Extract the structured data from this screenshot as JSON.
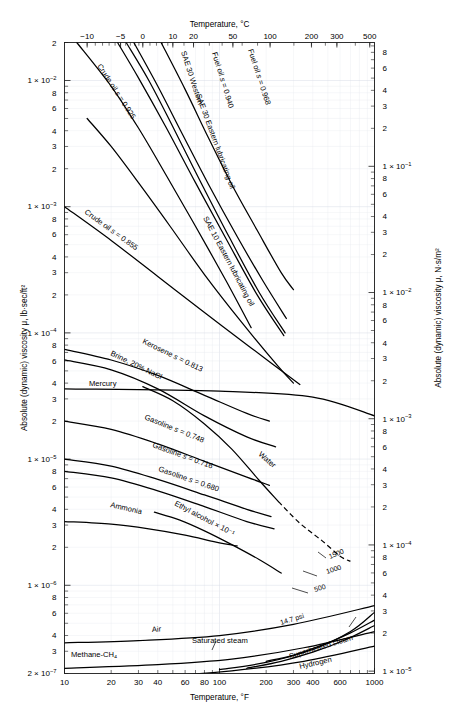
{
  "figure": {
    "title_top_axis": "Temperature, °C",
    "title_bottom_axis": "Temperature, °F",
    "title_left_axis": "Absolute (dynamic) viscosity μ, lb·sec/ft²",
    "title_right_axis": "Absolute (dynamic) viscosity μ, N·s/m²"
  },
  "axes": {
    "x_bottom": {
      "unit": "°F",
      "scale": "log",
      "range": [
        10,
        1000
      ],
      "tick_labels": [
        "10",
        "20",
        "30",
        "40",
        "60",
        "80",
        "100",
        "200",
        "300",
        "400",
        "600",
        "1000"
      ],
      "tick_values": [
        10,
        20,
        30,
        40,
        60,
        80,
        100,
        200,
        300,
        400,
        600,
        1000
      ]
    },
    "x_top": {
      "unit": "°C",
      "scale": "log-in-F",
      "tick_labels": [
        "−10",
        "−5",
        "0",
        "10",
        "20",
        "50",
        "100",
        "200",
        "300",
        "500"
      ],
      "tick_values_c": [
        -10,
        -5,
        0,
        10,
        20,
        50,
        100,
        200,
        300,
        500
      ]
    },
    "y_left": {
      "unit": "lb·sec/ft²",
      "scale": "log",
      "range": [
        2e-07,
        0.02
      ],
      "decade_labels": [
        "1 × 10⁻²",
        "1 × 10⁻³",
        "1 × 10⁻⁴",
        "1 × 10⁻⁵",
        "1 × 10⁻⁶",
        "2 × 10⁻⁷"
      ],
      "top_label": "2",
      "minor_labels": [
        "8",
        "6",
        "4",
        "3",
        "2"
      ]
    },
    "y_right": {
      "unit": "N·s/m²",
      "scale": "log",
      "decade_labels": [
        "1 × 10⁰",
        "1 × 10⁻¹",
        "1 × 10⁻²",
        "1 × 10⁻³",
        "1 × 10⁻⁴",
        "1 × 10⁻⁵"
      ],
      "minor_labels": [
        "8",
        "6",
        "4",
        "3",
        "2"
      ],
      "bottom_label": "8"
    }
  },
  "chart_data": {
    "type": "line",
    "title": "",
    "xlabel": "Temperature, °F",
    "ylabel": "Absolute (dynamic) viscosity μ, lb·sec/ft²",
    "xscale": "log",
    "yscale": "log",
    "xlim": [
      10,
      1000
    ],
    "ylim": [
      2e-07,
      0.02
    ],
    "grid": true,
    "legend": "inline-curve-labels",
    "series": [
      {
        "name": "Crude oil s = 0.925",
        "label": "Crude oil s = 0.925",
        "label_italic_part": "s",
        "x": [
          12,
          20,
          30,
          45,
          70,
          110,
          160
        ],
        "y": [
          0.02,
          0.009,
          0.0042,
          0.0018,
          0.0007,
          0.00026,
          0.00011
        ]
      },
      {
        "name": "SAE 30 Western lubricating oil",
        "label": "SAE 30 Western",
        "x": [
          22,
          30,
          45,
          70,
          110,
          175,
          260
        ],
        "y": [
          0.02,
          0.0105,
          0.0043,
          0.00155,
          0.00056,
          0.0002,
          9.5e-05
        ]
      },
      {
        "name": "SAE 30 Eastern lubricating oil",
        "label": "SAE 30 Eastern lubricating oil",
        "x": [
          25,
          35,
          50,
          75,
          115,
          180,
          265
        ],
        "y": [
          0.02,
          0.01,
          0.0043,
          0.0016,
          0.00058,
          0.00021,
          0.0001
        ]
      },
      {
        "name": "Fuel oil s = 0.940",
        "label": "Fuel oil s = 0.940",
        "label_italic_part": "s",
        "x": [
          28,
          40,
          58,
          85,
          130,
          190,
          270
        ],
        "y": [
          0.02,
          0.009,
          0.0037,
          0.0015,
          0.00058,
          0.00026,
          0.00013
        ]
      },
      {
        "name": "Fuel oil s = 0.968",
        "label": "Fuel oil s = 0.968",
        "label_italic_part": "s",
        "x": [
          42,
          60,
          85,
          120,
          175,
          250,
          300
        ],
        "y": [
          0.02,
          0.0085,
          0.0035,
          0.0015,
          0.00065,
          0.0003,
          0.00022
        ]
      },
      {
        "name": "SAE 10 Eastern lubricating oil",
        "label": "SAE 10 Eastern lubricating oil",
        "x": [
          14,
          20,
          30,
          48,
          80,
          140,
          240,
          300
        ],
        "y": [
          0.005,
          0.003,
          0.00155,
          0.0007,
          0.00029,
          0.00012,
          5.4e-05,
          4e-05
        ]
      },
      {
        "name": "Crude oil s = 0.855",
        "label": "Crude oil s = 0.855",
        "label_italic_part": "s",
        "x": [
          10,
          20,
          40,
          80,
          160,
          330
        ],
        "y": [
          0.001,
          0.00054,
          0.00028,
          0.000145,
          7.6e-05,
          3.9e-05
        ]
      },
      {
        "name": "Kerosene s = 0.813",
        "label": "Kerosene s = 0.813",
        "label_italic_part": "s",
        "x": [
          10,
          20,
          40,
          80,
          150,
          210
        ],
        "y": [
          7.4e-05,
          6.1e-05,
          4.6e-05,
          3.2e-05,
          2.3e-05,
          2e-05
        ]
      },
      {
        "name": "Brine, 20% NaCl",
        "label": "Brine, 20% NaCl",
        "x": [
          10,
          20,
          40,
          80,
          150,
          230
        ],
        "y": [
          6.1e-05,
          5.1e-05,
          3.6e-05,
          2.2e-05,
          1.5e-05,
          1.25e-05
        ]
      },
      {
        "name": "Mercury",
        "label": "Mercury",
        "x": [
          10,
          100,
          400,
          1000
        ],
        "y": [
          3.6e-05,
          3.45e-05,
          3.1e-05,
          2.2e-05
        ]
      },
      {
        "name": "Water",
        "label": "Water",
        "x": [
          32,
          50,
          80,
          120,
          180,
          240
        ],
        "y": [
          3.75e-05,
          2.9e-05,
          1.9e-05,
          1.2e-05,
          6.8e-06,
          4.6e-06
        ],
        "dashed_extension": {
          "x": [
            240,
            330,
            450,
            600,
            700
          ],
          "y": [
            4.6e-06,
            3.1e-06,
            2.3e-06,
            1.7e-06,
            1.55e-06
          ]
        }
      },
      {
        "name": "Gasoline s = 0.748",
        "label": "Gasoline s = 0.748",
        "label_italic_part": "s",
        "x": [
          10,
          20,
          40,
          80,
          150,
          210
        ],
        "y": [
          2e-05,
          1.72e-05,
          1.32e-05,
          9.6e-06,
          7.2e-06,
          6.2e-06
        ]
      },
      {
        "name": "Gasoline s = 0.716",
        "label": "Gasoline s = 0.716",
        "label_italic_part": "s",
        "x": [
          10,
          20,
          40,
          80,
          150,
          215
        ],
        "y": [
          1e-05,
          8.8e-06,
          6.9e-06,
          5.2e-06,
          4e-06,
          3.5e-06
        ]
      },
      {
        "name": "Gasoline s = 0.680",
        "label": "Gasoline s = 0.680",
        "label_italic_part": "s",
        "x": [
          10,
          20,
          40,
          80,
          150,
          225
        ],
        "y": [
          8e-06,
          7.1e-06,
          5.6e-06,
          4.2e-06,
          3.2e-06,
          2.8e-06
        ]
      },
      {
        "name": "Ammonia",
        "label": "Ammonia",
        "x": [
          10,
          20,
          35,
          60,
          95,
          130
        ],
        "y": [
          3.2e-06,
          3.05e-06,
          2.8e-06,
          2.5e-06,
          2.2e-06,
          2.05e-06
        ]
      },
      {
        "name": "Ethyl alcohol × 10⁻¹",
        "label": "Ethyl alcohol × 10⁻¹",
        "x": [
          38,
          55,
          80,
          120,
          180,
          250
        ],
        "y": [
          3.8e-06,
          3.3e-06,
          2.7e-06,
          2.1e-06,
          1.6e-06,
          1.25e-06
        ]
      },
      {
        "name": "Air",
        "label": "Air",
        "x": [
          10,
          30,
          100,
          300,
          1000
        ],
        "y": [
          3.5e-07,
          3.65e-07,
          4e-07,
          4.9e-07,
          6.9e-07
        ]
      },
      {
        "name": "Saturated steam",
        "label": "Saturated steam",
        "x": [
          100,
          200,
          400,
          700,
          1000
        ],
        "y": [
          2.15e-07,
          2.45e-07,
          3.1e-07,
          4.3e-07,
          6.1e-07
        ]
      },
      {
        "name": "Superheated steam 14.7 psi",
        "label": "14.7 psi",
        "x": [
          200,
          300,
          500,
          700,
          1000
        ],
        "y": [
          2.5e-07,
          2.8e-07,
          3.5e-07,
          4.2e-07,
          5.3e-07
        ]
      },
      {
        "name": "Superheated steam",
        "label": "Superheated steam",
        "x": [
          150,
          250,
          400,
          650,
          1000
        ],
        "y": [
          2.2e-07,
          2.5e-07,
          2.95e-07,
          3.7e-07,
          4.8e-07
        ]
      },
      {
        "name": "Hydrogen",
        "label": "Hydrogen",
        "x": [
          10,
          40,
          120,
          350,
          1000
        ],
        "y": [
          1.8e-07,
          1.9e-07,
          2.1e-07,
          2.5e-07,
          3.3e-07
        ]
      },
      {
        "name": "Methane-CH4",
        "label": "Methane-CH₄",
        "x": [
          10,
          40,
          120,
          350,
          1000
        ],
        "y": [
          2.2e-07,
          2.35e-07,
          2.6e-07,
          3.2e-07,
          4.3e-07
        ]
      }
    ],
    "pressure_annotations": [
      {
        "label": "1500",
        "value": 1500,
        "unit": "psi"
      },
      {
        "label": "1000",
        "value": 1000,
        "unit": "psi"
      },
      {
        "label": "500",
        "value": 500,
        "unit": "psi"
      },
      {
        "label": "14.7 psi",
        "value": 14.7,
        "unit": "psi"
      }
    ]
  }
}
